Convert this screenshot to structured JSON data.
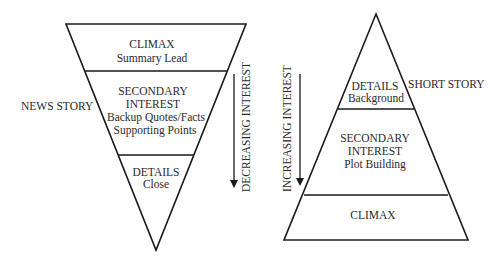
{
  "news_story": {
    "title": "NEWS STORY",
    "sections": [
      {
        "heading": "CLIMAX",
        "lines": [
          "Summary Lead"
        ]
      },
      {
        "heading_lines": [
          "SECONDARY",
          "INTEREST"
        ],
        "lines": [
          "Backup Quotes/Facts",
          "Supporting Points"
        ]
      },
      {
        "heading": "DETAILS",
        "lines": [
          "Close"
        ]
      }
    ],
    "arrow_label": "DECREASING INTEREST"
  },
  "short_story": {
    "title": "SHORT STORY",
    "sections": [
      {
        "heading": "DETAILS",
        "lines": [
          "Background"
        ]
      },
      {
        "heading_lines": [
          "SECONDARY",
          "INTEREST"
        ],
        "lines": [
          "Plot Building"
        ]
      },
      {
        "heading": "CLIMAX",
        "lines": []
      }
    ],
    "arrow_label": "INCREASING INTEREST"
  },
  "colors": {
    "stroke": "#1a1a1a",
    "text": "#2a2a2a"
  }
}
